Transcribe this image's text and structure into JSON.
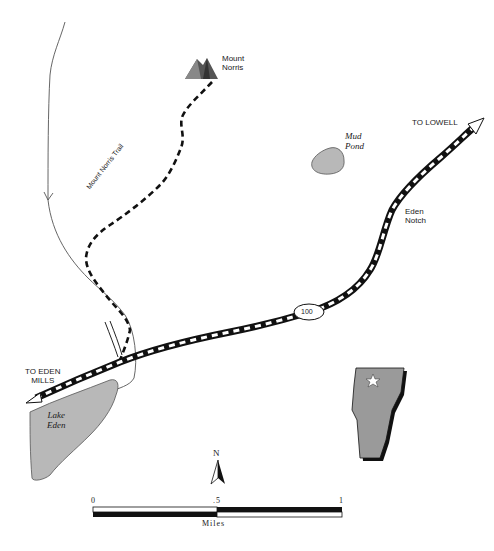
{
  "map": {
    "colors": {
      "water": "#b8b8b8",
      "state": "#9a9a9a",
      "road": "#111111",
      "stream": "#555555",
      "ink": "#1a1a1a"
    },
    "features": {
      "mountain": {
        "name_line1": "Mount",
        "name_line2": "Norris"
      },
      "pond": {
        "name_line1": "Mud",
        "name_line2": "Pond"
      },
      "lake": {
        "name_line1": "Lake",
        "name_line2": "Eden"
      },
      "notch": {
        "name_line1": "Eden",
        "name_line2": "Notch"
      },
      "trail": {
        "name": "Mount Norris Trail"
      }
    },
    "road": {
      "route_number": "100",
      "east_destination": "TO LOWELL",
      "west_destination_line1": "TO EDEN",
      "west_destination_line2": "MILLS"
    },
    "north_arrow": {
      "label": "N"
    },
    "scale_bar": {
      "ticks": [
        "0",
        ".5",
        "1"
      ],
      "unit": "Miles"
    },
    "locator": {
      "icon": "star-icon"
    }
  }
}
